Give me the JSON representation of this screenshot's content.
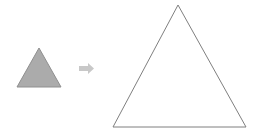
{
  "canvas": {
    "width": 258,
    "height": 140,
    "background_color": "#ffffff",
    "title": "Triangle enlargement diagram"
  },
  "palette": {
    "small_triangle_fill": "#ababab",
    "small_triangle_stroke": "#8f8f8f",
    "large_triangle_fill": "#ffffff",
    "large_triangle_stroke": "#7f7f7f",
    "arrow_fill": "#c8c8c8",
    "background": "#ffffff"
  },
  "figures": {
    "small_triangle": {
      "name": "small-triangle",
      "label": "Small shaded triangle",
      "shape": "triangle",
      "filled": true,
      "fill_color": "#ababab",
      "stroke_color": "#8f8f8f",
      "stroke_width": 1,
      "apex": {
        "x": 39,
        "y": 48
      },
      "base_left": {
        "x": 17,
        "y": 87
      },
      "base_right": {
        "x": 61,
        "y": 87
      },
      "base_width": 44,
      "height": 39,
      "points": "39,48 61,87 17,87"
    },
    "arrow": {
      "name": "transform-arrow",
      "label": "Right-pointing arrow",
      "shape": "block-arrow",
      "direction": "right",
      "fill_color": "#c8c8c8",
      "x": 79,
      "y": 63,
      "width": 15,
      "height": 11,
      "points": "79,66 88,66 88,63 94,68.5 88,74 88,71 79,71"
    },
    "large_triangle": {
      "name": "large-triangle",
      "label": "Large outlined triangle",
      "shape": "triangle",
      "filled": false,
      "fill_color": "#ffffff",
      "stroke_color": "#7f7f7f",
      "stroke_width": 1,
      "apex": {
        "x": 178,
        "y": 5
      },
      "base_left": {
        "x": 113,
        "y": 127
      },
      "base_right": {
        "x": 246,
        "y": 127
      },
      "base_width": 133,
      "height": 122,
      "points": "178,5 246,127 113,127"
    }
  },
  "relationship": {
    "type": "enlargement",
    "scale_factor": "3"
  }
}
